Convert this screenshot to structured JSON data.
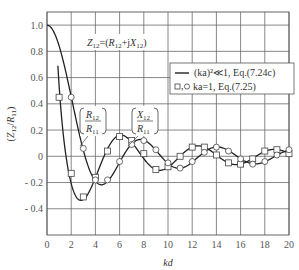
{
  "chart_data": {
    "type": "line",
    "title": "",
    "xlabel": "kd",
    "ylabel": "(Z12/R11)",
    "xlim": [
      0,
      20
    ],
    "ylim": [
      -0.6,
      1.1
    ],
    "x_ticks": [
      "0",
      "2",
      "4",
      "6",
      "8",
      "10",
      "12",
      "14",
      "16",
      "18",
      "20"
    ],
    "y_ticks": [
      "1.0",
      "0.8",
      "0.6",
      "0.4",
      "0.2",
      "0",
      "- 0.2",
      "- 0.4"
    ],
    "grid": true,
    "annotations": {
      "formula": "Z12=(R12+jX12)",
      "r_label_num": "R12",
      "r_label_den": "R11",
      "x_label_num": "X12",
      "x_label_den": "R11"
    },
    "legend": {
      "position": "upper right",
      "entries": [
        {
          "marker": "line",
          "label": "(ka)²≪1, Eq.(7.24c)"
        },
        {
          "marker": "square-circle",
          "label": "ka=1, Eq.(7.25)"
        }
      ]
    },
    "series": [
      {
        "name": "R12/R11 (ka)^2<<1, Eq.(7.24c)",
        "style": "line",
        "x": [
          0,
          1,
          2,
          3,
          4,
          4.5,
          5,
          6,
          7,
          7.7,
          8,
          9,
          10,
          11,
          12,
          13,
          14,
          15,
          16,
          17,
          18,
          19,
          20
        ],
        "values": [
          1.0,
          0.84,
          0.45,
          0.05,
          -0.19,
          -0.22,
          -0.19,
          -0.05,
          0.09,
          0.13,
          0.12,
          0.05,
          -0.05,
          -0.09,
          -0.04,
          0.03,
          0.07,
          0.04,
          -0.02,
          -0.06,
          -0.04,
          0.01,
          0.05
        ]
      },
      {
        "name": "X12/R11 (ka)^2<<1, Eq.(7.24c)",
        "style": "line",
        "x": [
          0.9,
          1,
          1.5,
          2,
          2.5,
          3,
          3.5,
          4,
          5,
          6,
          6.5,
          7,
          8,
          9,
          9.5,
          10,
          11,
          12,
          13,
          14,
          15,
          16,
          17,
          18,
          19,
          20
        ],
        "values": [
          1.1,
          0.54,
          0.05,
          -0.21,
          -0.32,
          -0.33,
          -0.27,
          -0.16,
          0.06,
          0.16,
          0.15,
          0.11,
          -0.02,
          -0.1,
          -0.105,
          -0.08,
          0.0,
          0.07,
          0.07,
          0.01,
          -0.05,
          -0.06,
          -0.02,
          0.04,
          0.05,
          0.02
        ]
      },
      {
        "name": "X12/R11 ka=1, Eq.(7.25) (squares)",
        "style": "square",
        "x": [
          1,
          2,
          3,
          4,
          5,
          6,
          7,
          8,
          9,
          10,
          11,
          12,
          13,
          14,
          15,
          16,
          17,
          18,
          19,
          20
        ],
        "values": [
          0.45,
          -0.13,
          -0.31,
          -0.16,
          0.04,
          0.15,
          0.12,
          0.02,
          -0.1,
          -0.08,
          0.0,
          0.07,
          0.07,
          0.01,
          -0.05,
          -0.06,
          -0.02,
          0.04,
          0.05,
          0.02
        ]
      },
      {
        "name": "R12/R11 ka=1, Eq.(7.25) (circles)",
        "style": "circle",
        "x": [
          2,
          3,
          4,
          5,
          6,
          7,
          8,
          9,
          10,
          11,
          12,
          13,
          14,
          15,
          16,
          17,
          18,
          19,
          20
        ],
        "values": [
          0.45,
          0.06,
          -0.18,
          -0.18,
          -0.04,
          0.09,
          0.12,
          0.05,
          -0.05,
          -0.09,
          -0.04,
          0.03,
          0.07,
          0.04,
          -0.02,
          -0.06,
          -0.04,
          0.01,
          0.05
        ]
      }
    ]
  }
}
